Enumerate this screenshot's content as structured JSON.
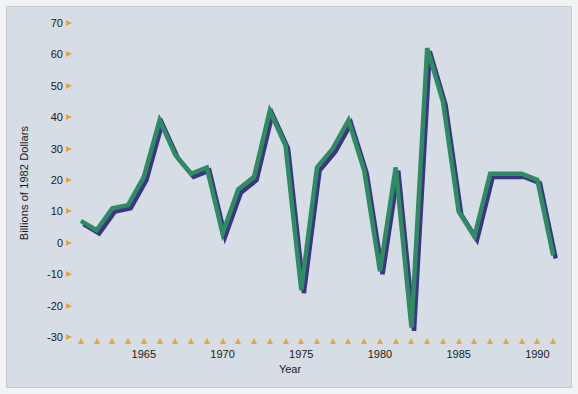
{
  "chart_data": {
    "type": "line",
    "title": "",
    "xlabel": "Year",
    "ylabel": "Billions of 1982 Dollars",
    "xlim": [
      1960.5,
      1991.5
    ],
    "ylim": [
      -30,
      70
    ],
    "grid": false,
    "legend": "none",
    "x_tick_labels": [
      "1965",
      "1970",
      "1975",
      "1980",
      "1985",
      "1990"
    ],
    "x_tick_values": [
      1965,
      1970,
      1975,
      1980,
      1985,
      1990
    ],
    "y_tick_labels": [
      "70",
      "60",
      "50",
      "40",
      "30",
      "20",
      "10",
      "0",
      "-10",
      "-20",
      "-30"
    ],
    "y_tick_values": [
      70,
      60,
      50,
      40,
      30,
      20,
      10,
      0,
      -10,
      -20,
      -30
    ],
    "x": [
      1961,
      1962,
      1963,
      1964,
      1965,
      1966,
      1967,
      1968,
      1969,
      1970,
      1971,
      1972,
      1973,
      1974,
      1975,
      1976,
      1977,
      1978,
      1979,
      1980,
      1981,
      1982,
      1983,
      1984,
      1985,
      1986,
      1987,
      1988,
      1989,
      1990,
      1991
    ],
    "series": [
      {
        "name": "Change in business inventories",
        "color": "#2e8b62",
        "shadow_color": "#3b3583",
        "values": [
          7,
          4,
          11,
          12,
          21,
          39,
          28,
          22,
          24,
          3,
          17,
          21,
          42,
          31,
          -15,
          24,
          30,
          39,
          23,
          -9,
          24,
          -27,
          62,
          45,
          10,
          2,
          22,
          22,
          22,
          20,
          -4
        ]
      }
    ]
  },
  "axes": {
    "y_axis_label": "Billions of 1982 Dollars",
    "x_axis_label": "Year"
  },
  "colors": {
    "line": "#2e8b62",
    "shadow": "#3b3583",
    "plot_background": "#d6dde4",
    "tick_marker": "#e8a33d",
    "page_background": "#f2f3f4"
  }
}
